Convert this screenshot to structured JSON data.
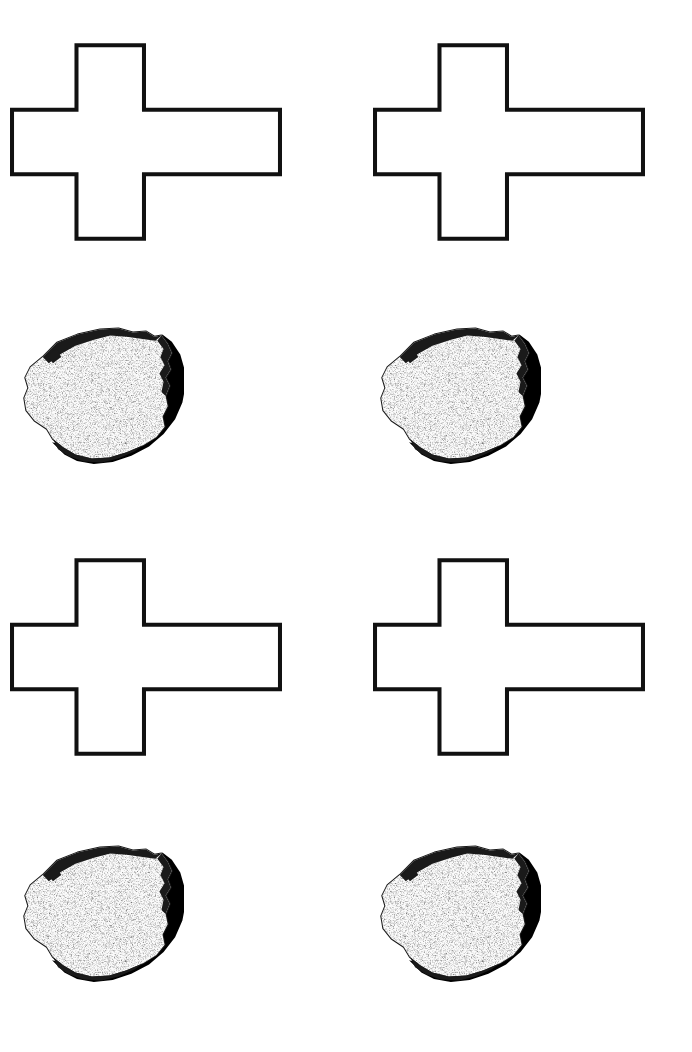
{
  "page": {
    "title": "Stimulus Sheet",
    "background_color": "#ffffff",
    "width": 692,
    "height": 1052
  },
  "palette": {
    "background": "#ffffff",
    "ink": "#111111",
    "stroke": "#111111",
    "fill": "#ffffff",
    "shadow": "#000000",
    "rock_body": "#fbfbfb",
    "rock_speckle": "#1a1a1a"
  },
  "figures": {
    "cross": {
      "name": "cross-outline",
      "label": "Cross outline",
      "stroke_color": "#111111",
      "fill_color": "#ffffff",
      "stroke_width": 4,
      "width": 270,
      "height": 196,
      "geometry": {
        "left_arm_x": 0,
        "vertical_bar_left": 66,
        "vertical_bar_right": 133,
        "right_arm_x": 270,
        "top_y": 0,
        "horizontal_bar_top": 66,
        "horizontal_bar_bottom": 130,
        "bottom_y": 196
      },
      "note": "Asymmetric cross: right arm is longer than the left arm."
    },
    "rock": {
      "name": "rock-photograph",
      "label": "Speckled rock specimen",
      "body_color": "#fbfbfb",
      "outline_color": "#1a1a1a",
      "shadow_color": "#000000",
      "width": 168,
      "height": 150,
      "note": "High-contrast black and white photograph; hard cast shadow on lower-right."
    }
  },
  "cells": [
    {
      "id": "cell-top-left",
      "row": 1,
      "column": 1,
      "cross": {
        "name": "cross-top-left",
        "x": 10,
        "y": 42,
        "width": 272,
        "height": 200
      },
      "rock": {
        "name": "rock-top-left",
        "x": 12,
        "y": 318,
        "width": 172,
        "height": 154
      }
    },
    {
      "id": "cell-top-right",
      "row": 1,
      "column": 2,
      "cross": {
        "name": "cross-top-right",
        "x": 373,
        "y": 42,
        "width": 272,
        "height": 200
      },
      "rock": {
        "name": "rock-top-right",
        "x": 369,
        "y": 318,
        "width": 172,
        "height": 154
      }
    },
    {
      "id": "cell-bottom-left",
      "row": 2,
      "column": 1,
      "cross": {
        "name": "cross-bottom-left",
        "x": 10,
        "y": 557,
        "width": 272,
        "height": 200
      },
      "rock": {
        "name": "rock-bottom-left",
        "x": 12,
        "y": 836,
        "width": 172,
        "height": 154
      }
    },
    {
      "id": "cell-bottom-right",
      "row": 2,
      "column": 2,
      "cross": {
        "name": "cross-bottom-right",
        "x": 373,
        "y": 557,
        "width": 272,
        "height": 200
      },
      "rock": {
        "name": "rock-bottom-right",
        "x": 369,
        "y": 836,
        "width": 172,
        "height": 154
      }
    }
  ]
}
